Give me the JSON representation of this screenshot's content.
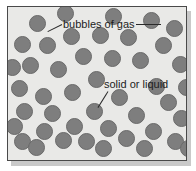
{
  "diagram": {
    "type": "particle-model-diagram",
    "title": "",
    "frame": {
      "background_color": "#e9e9e7",
      "border_color": "#4a4a4a",
      "shadow_color": "#c9c9c9"
    },
    "particle": {
      "fill_color": "#7e7e7e",
      "edge_color": "#6a6a6a",
      "shape": "circle",
      "count": 45,
      "diameter_px": 17
    },
    "labels": [
      {
        "id": "bubbles-of-gas",
        "text": "bubbles of gas",
        "x": 55,
        "y": 12,
        "leaders": [
          {
            "x1": 54,
            "y1": 17,
            "x2": 40,
            "y2": 24
          },
          {
            "x1": 128,
            "y1": 17,
            "x2": 153,
            "y2": 17
          }
        ]
      },
      {
        "id": "solid-or-liquid",
        "text": "solid or liquid",
        "x": 96,
        "y": 72,
        "leaders": [
          {
            "x1": 100,
            "y1": 84,
            "x2": 90,
            "y2": 100
          }
        ]
      }
    ],
    "particles": [
      {
        "x": 29,
        "y": 16
      },
      {
        "x": 143,
        "y": 13
      },
      {
        "x": 166,
        "y": 21
      },
      {
        "x": 63,
        "y": 29
      },
      {
        "x": 92,
        "y": 28
      },
      {
        "x": 120,
        "y": 30
      },
      {
        "x": 155,
        "y": 38
      },
      {
        "x": 14,
        "y": 37
      },
      {
        "x": 39,
        "y": 38
      },
      {
        "x": 75,
        "y": 49
      },
      {
        "x": 104,
        "y": 51
      },
      {
        "x": 132,
        "y": 53
      },
      {
        "x": 172,
        "y": 57
      },
      {
        "x": 22,
        "y": 58
      },
      {
        "x": 50,
        "y": 62
      },
      {
        "x": 88,
        "y": 72
      },
      {
        "x": 11,
        "y": 81
      },
      {
        "x": 148,
        "y": 79
      },
      {
        "x": 64,
        "y": 85
      },
      {
        "x": 35,
        "y": 89
      },
      {
        "x": 111,
        "y": 90
      },
      {
        "x": 160,
        "y": 95
      },
      {
        "x": 16,
        "y": 104
      },
      {
        "x": 86,
        "y": 104
      },
      {
        "x": 44,
        "y": 106
      },
      {
        "x": 128,
        "y": 108
      },
      {
        "x": 6,
        "y": 119
      },
      {
        "x": 173,
        "y": 111
      },
      {
        "x": 66,
        "y": 119
      },
      {
        "x": 100,
        "y": 121
      },
      {
        "x": 36,
        "y": 124
      },
      {
        "x": 145,
        "y": 124
      },
      {
        "x": 14,
        "y": 134
      },
      {
        "x": 78,
        "y": 134
      },
      {
        "x": 55,
        "y": 133
      },
      {
        "x": 118,
        "y": 131
      },
      {
        "x": 167,
        "y": 134
      },
      {
        "x": 28,
        "y": 140
      },
      {
        "x": 95,
        "y": 141
      },
      {
        "x": 136,
        "y": 141
      },
      {
        "x": 4,
        "y": 60
      },
      {
        "x": 178,
        "y": 80
      },
      {
        "x": 57,
        "y": 6
      },
      {
        "x": 105,
        "y": 9
      },
      {
        "x": 180,
        "y": 141
      }
    ]
  }
}
